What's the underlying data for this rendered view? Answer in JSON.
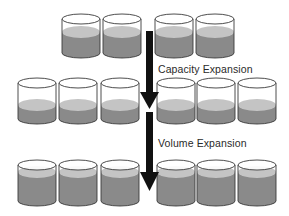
{
  "diagram": {
    "labels": {
      "capacity": "Capacity Expansion",
      "volume": "Volume Expansion"
    },
    "colors": {
      "outline": "#3a3a3a",
      "liquid_top": "#c4c4c4",
      "liquid_body": "#8a8a8a",
      "arrow": "#111111",
      "background": "#ffffff"
    },
    "rows": [
      {
        "name": "initial",
        "top": 14,
        "bottom": 58,
        "fill_level": 27,
        "cylinders": [
          62,
          103,
          155,
          196
        ]
      },
      {
        "name": "after-capacity-expansion",
        "top": 78,
        "bottom": 124,
        "fill_level": 100,
        "cylinders": [
          18,
          59,
          101,
          157,
          197,
          238
        ]
      },
      {
        "name": "after-volume-expansion",
        "top": 160,
        "bottom": 206,
        "fill_level": 167,
        "cylinders": [
          18,
          59,
          101,
          157,
          197,
          238
        ]
      }
    ]
  }
}
